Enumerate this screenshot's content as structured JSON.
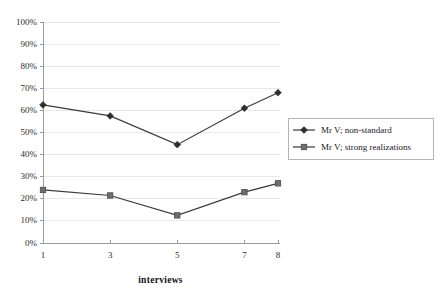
{
  "chart_data": {
    "type": "line",
    "title": "",
    "xlabel": "interviews",
    "ylabel": "",
    "categories": [
      "1",
      "3",
      "5",
      "7",
      "8"
    ],
    "x": [
      1,
      3,
      5,
      7,
      8
    ],
    "xlim": [
      1,
      8
    ],
    "ylim": [
      0,
      100
    ],
    "ytick_labels": [
      "100%",
      "90%",
      "80%",
      "70%",
      "60%",
      "50%",
      "40%",
      "30%",
      "20%",
      "10%",
      "0%"
    ],
    "ytick_values": [
      100,
      90,
      80,
      70,
      60,
      50,
      40,
      30,
      20,
      10,
      0
    ],
    "grid": true,
    "legend_position": "right",
    "series": [
      {
        "name": "Mr V; non-standard",
        "marker": "diamond",
        "color": "#2e2e2e",
        "values": [
          62.5,
          57.5,
          44.5,
          61.0,
          68.0
        ]
      },
      {
        "name": "Mr V; strong realizations",
        "marker": "square",
        "color": "#6e6e6e",
        "values": [
          24.0,
          21.5,
          12.5,
          23.0,
          27.0
        ]
      }
    ]
  },
  "legend": {
    "entries": [
      {
        "label": "Mr V; non-standard"
      },
      {
        "label": "Mr V; strong realizations"
      }
    ]
  },
  "axes": {
    "x_title": "interviews"
  }
}
